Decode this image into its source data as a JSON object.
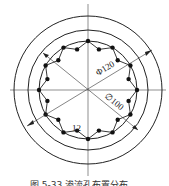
{
  "diagram": {
    "labels": {
      "outer_diameter": "Φ120",
      "inner_diameter": "∅100",
      "hole_count": "12"
    },
    "caption": "图 5-33  渗流孔布置分布",
    "colors": {
      "line": "#222222",
      "dot": "#111111",
      "background": "#ffffff"
    }
  }
}
